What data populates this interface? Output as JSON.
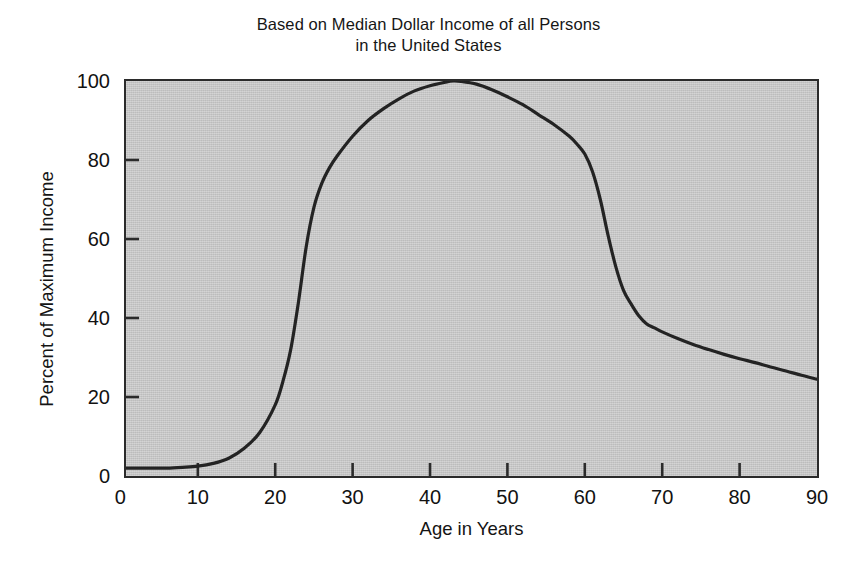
{
  "chart_data": {
    "type": "line",
    "title": "Based on Median Dollar Income of all Persons in the United States",
    "title_lines": [
      "Based on Median Dollar Income of all Persons",
      "in the United States"
    ],
    "xlabel": "Age in Years",
    "ylabel": "Percent of Maximum Income",
    "xlim": [
      0,
      90
    ],
    "ylim": [
      0,
      100
    ],
    "xticks": [
      0,
      10,
      20,
      30,
      40,
      50,
      60,
      70,
      80,
      90
    ],
    "xtick_labels": [
      "0",
      "10",
      "20",
      "30",
      "40",
      "50",
      "60",
      "70",
      "80",
      "90"
    ],
    "yticks": [
      0,
      20,
      40,
      60,
      80,
      100
    ],
    "ytick_labels": [
      "0",
      "20",
      "40",
      "60",
      "80",
      "100"
    ],
    "grid": false,
    "legend": null,
    "plot_background_color": "#c6c6c6",
    "line_color": "#232323",
    "line_width": 3.2,
    "series": [
      {
        "name": "Percent of Maximum Income",
        "x": [
          0,
          2,
          4,
          6,
          8,
          10,
          12,
          14,
          16,
          18,
          20,
          21,
          22,
          23,
          24,
          25,
          26,
          27,
          28,
          30,
          32,
          34,
          36,
          38,
          40,
          42,
          43,
          44,
          46,
          48,
          50,
          52,
          54,
          56,
          58,
          59,
          60,
          61,
          62,
          63,
          64,
          65,
          66,
          67,
          68,
          69,
          70,
          72,
          74,
          76,
          78,
          80,
          82,
          84,
          86,
          88,
          90
        ],
        "y": [
          2,
          2,
          2,
          2,
          2.2,
          2.5,
          3.2,
          4.5,
          7,
          11,
          18,
          24,
          32,
          44,
          58,
          68,
          74,
          78,
          81,
          86,
          90,
          93,
          95.5,
          97.5,
          98.8,
          99.7,
          100,
          99.9,
          99.2,
          97.8,
          96,
          94,
          91.5,
          89,
          86,
          84,
          81.5,
          77,
          70,
          61,
          53,
          47,
          43.5,
          40.5,
          38.5,
          37.5,
          36.5,
          34.8,
          33.3,
          32,
          30.8,
          29.7,
          28.7,
          27.6,
          26.6,
          25.5,
          24.5
        ]
      }
    ],
    "annotations": {
      "peak_age": 43,
      "peak_value": 100,
      "notes": "Smooth S-shaped rise from near 0% below age 15 to a 100% peak near age 43, then a steep drop through the early 60s and a gentle tail to about 24% at age 90."
    }
  }
}
